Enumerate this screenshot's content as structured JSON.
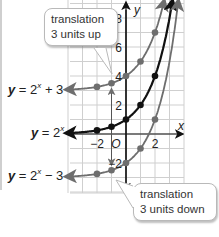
{
  "figure": {
    "callouts": {
      "up": {
        "line1": "translation",
        "line2": "3 units up"
      },
      "down": {
        "line1": "translation",
        "line2": "3 units down"
      }
    },
    "equations": {
      "plus3": {
        "y": "y",
        "eq": " = 2",
        "exp": "x",
        "rest": " + 3"
      },
      "base": {
        "y": "y",
        "eq": " = 2",
        "exp": "x",
        "rest": ""
      },
      "minus3": {
        "y": "y",
        "eq": " = 2",
        "exp": "x",
        "rest": " − 3"
      }
    },
    "axes": {
      "x_label": "x",
      "y_label": "y",
      "origin_label": "O"
    },
    "colors": {
      "base_curve": "#111111",
      "translated_curve": "#6e6e6e",
      "grid": "#cfcfcf",
      "axis": "#111111"
    }
  },
  "chart_data": {
    "type": "line",
    "title": "",
    "xlabel": "x",
    "ylabel": "y",
    "xlim": [
      -4,
      4
    ],
    "ylim": [
      -4,
      9
    ],
    "x_ticks": [
      -2,
      2
    ],
    "y_ticks": [
      -2,
      2,
      4,
      6,
      8
    ],
    "grid": true,
    "series": [
      {
        "name": "y = 2^x + 3",
        "x": [
          -2,
          -1,
          0,
          1,
          2
        ],
        "y": [
          3.25,
          3.5,
          4,
          5,
          7
        ],
        "color": "#6e6e6e"
      },
      {
        "name": "y = 2^x",
        "x": [
          -2,
          -1,
          0,
          1,
          2
        ],
        "y": [
          0.25,
          0.5,
          1,
          2,
          4
        ],
        "color": "#111111"
      },
      {
        "name": "y = 2^x - 3",
        "x": [
          -2,
          -1,
          0,
          1,
          2
        ],
        "y": [
          -2.75,
          -2.5,
          -2,
          -1,
          1
        ],
        "color": "#6e6e6e"
      }
    ],
    "annotations": [
      "translation 3 units up",
      "translation 3 units down"
    ]
  }
}
